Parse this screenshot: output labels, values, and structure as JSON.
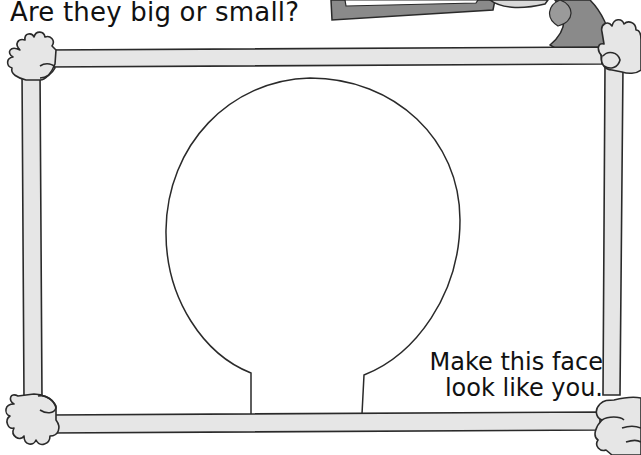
{
  "page": {
    "question": "Are they big or small?",
    "caption_line1": "Make this face",
    "caption_line2": "look like you."
  },
  "illustration": {
    "frame": "picture-frame-held-by-hands",
    "face_outline": "blank-head-outline",
    "colors": {
      "frame_fill": "#e6e6e6",
      "outline": "#2a2a2a",
      "dark_shape": "#8a8a8a",
      "background": "#ffffff"
    }
  }
}
